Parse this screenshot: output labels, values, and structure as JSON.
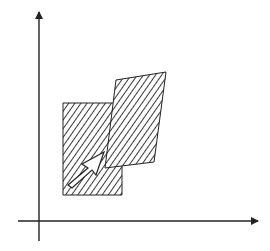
{
  "diagram": {
    "colors": {
      "background": "#ffffff",
      "stroke": "#222222",
      "hatch": "#222222",
      "arrow_fill": "#ffffff"
    },
    "axes": {
      "x_axis": {
        "x1": 18,
        "y": 221,
        "x2": 258
      },
      "y_axis": {
        "x": 39,
        "y1": 241,
        "y2": 12
      }
    },
    "shapes": [
      {
        "name": "rectangle",
        "points": [
          [
            63,
            103
          ],
          [
            122,
            103
          ],
          [
            122,
            195
          ],
          [
            63,
            195
          ]
        ],
        "fill": "diagonal-hatch"
      },
      {
        "name": "sheared-parallelogram",
        "points": [
          [
            116,
            80
          ],
          [
            166,
            72
          ],
          [
            154,
            162
          ],
          [
            105,
            168
          ]
        ],
        "fill": "diagonal-hatch"
      }
    ],
    "arrow": {
      "points": [
        [
          68,
          185
        ],
        [
          88,
          168
        ],
        [
          82,
          164
        ],
        [
          104,
          152
        ],
        [
          96,
          175
        ],
        [
          92,
          170
        ],
        [
          72,
          188
        ]
      ],
      "fill": "white",
      "direction": "up-right"
    }
  }
}
